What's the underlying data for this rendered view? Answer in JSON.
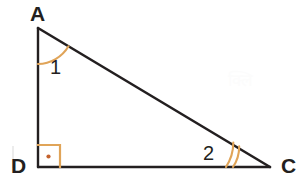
{
  "figure": {
    "background_color": "#ffffff",
    "stroke_color": "#231f20",
    "mark_color": "#e0a458",
    "vertices": {
      "A": {
        "label": "A",
        "x": 38,
        "y": 28
      },
      "D": {
        "label": "D",
        "x": 38,
        "y": 167
      },
      "C": {
        "label": "C",
        "x": 270,
        "y": 167
      }
    },
    "sides": [
      {
        "name": "AD",
        "from": "A",
        "to": "D"
      },
      {
        "name": "DC",
        "from": "D",
        "to": "C"
      },
      {
        "name": "AC",
        "from": "A",
        "to": "C"
      }
    ],
    "angle_labels": {
      "at_A": "1",
      "at_C": "2"
    },
    "angle_marks": {
      "at_A": {
        "type": "single-arc",
        "arcs": 1,
        "color": "#e0a458"
      },
      "at_C": {
        "type": "double-arc",
        "arcs": 2,
        "color": "#e0a458"
      },
      "at_D": {
        "type": "right-angle-square-with-dot",
        "color": "#e0a458",
        "dot_color": "#c4622d"
      }
    },
    "watermark": "क्लि"
  }
}
